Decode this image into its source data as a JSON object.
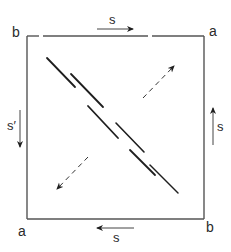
{
  "diagram": {
    "type": "square identification / gluing diagram",
    "corners": {
      "top_left": "b",
      "top_right": "a",
      "bottom_left": "a",
      "bottom_right": "b"
    },
    "edges": {
      "top": {
        "label": "s",
        "direction": "right"
      },
      "right": {
        "label": "s",
        "direction": "up"
      },
      "bottom": {
        "label": "s",
        "direction": "left"
      },
      "left": {
        "label": "s′",
        "direction": "down"
      }
    },
    "interior": {
      "diagonal_strands": 6,
      "dashed_arrows": [
        {
          "direction": "up-right"
        },
        {
          "direction": "down-left"
        }
      ]
    },
    "colors": {
      "line": "#555555",
      "ink": "#1e1e1e",
      "background": "#ffffff"
    }
  }
}
